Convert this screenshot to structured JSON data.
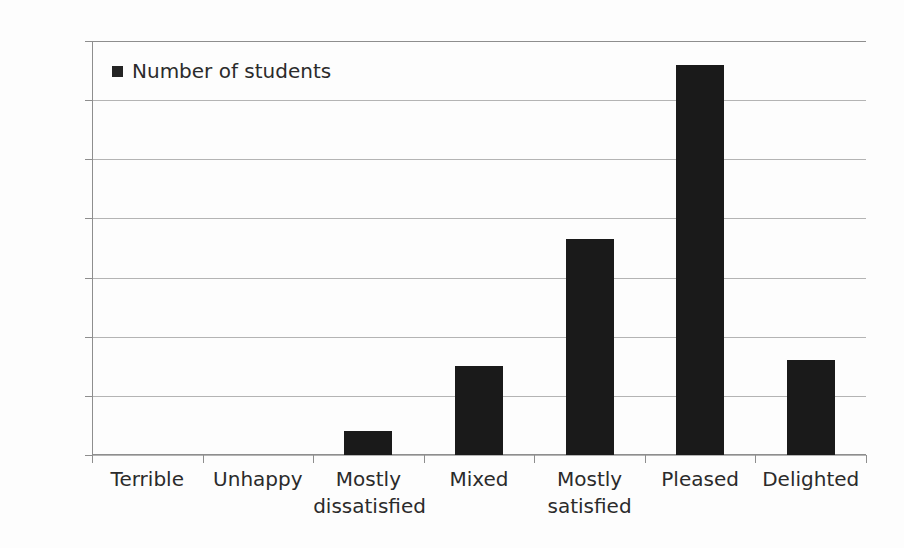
{
  "chart_data": {
    "type": "bar",
    "title": "",
    "subtitle": "",
    "xlabel": "",
    "ylabel": "",
    "categories": [
      "Terrible",
      "Unhappy",
      "Mostly dissatisfied",
      "Mixed",
      "Mostly satisfied",
      "Pleased",
      "Delighted"
    ],
    "category_lines": [
      [
        "Terrible"
      ],
      [
        "Unhappy"
      ],
      [
        "Mostly",
        "dissatisfied"
      ],
      [
        "Mixed"
      ],
      [
        "Mostly",
        "satisfied"
      ],
      [
        "Pleased"
      ],
      [
        "Delighted"
      ]
    ],
    "series": [
      {
        "name": "Number of students",
        "values": [
          0,
          0,
          8,
          30,
          73,
          132,
          32
        ],
        "color": "#1a1a1a"
      }
    ],
    "values": [
      0,
      0,
      8,
      30,
      73,
      132,
      32
    ],
    "ylim": [
      0,
      140
    ],
    "ytick_values": [
      0,
      20,
      40,
      60,
      80,
      100,
      120,
      140
    ],
    "ytick_labels": [
      "0",
      "20",
      "40",
      "60",
      "80",
      "100",
      "120",
      "140"
    ],
    "grid": true,
    "grid_axis": "y",
    "legend": {
      "position": "inside-top-left",
      "entries": [
        {
          "label": "Number of students",
          "marker": "square",
          "color": "#242424"
        }
      ]
    },
    "colors": {
      "bar": "#1a1a1a",
      "gridline": "#b4b4b4",
      "axis": "#8e8e8e",
      "text": "#2b2b2b",
      "background": "#fdfdfd"
    }
  }
}
